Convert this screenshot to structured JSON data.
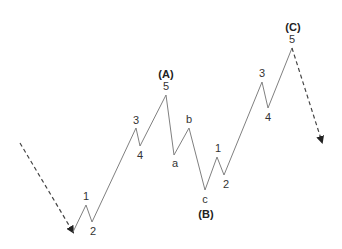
{
  "diagram": {
    "colors": {
      "line": "#808080",
      "text": "#333333",
      "arrow": "#222222"
    },
    "lead_in": {
      "from": [
        20,
        143
      ],
      "to": [
        73,
        232
      ],
      "style": "dashed",
      "arrow": true
    },
    "wave_path": [
      [
        73,
        232
      ],
      [
        86,
        205
      ],
      [
        92,
        222
      ],
      [
        136,
        128
      ],
      [
        140,
        146
      ],
      [
        166,
        95
      ],
      [
        174,
        155
      ],
      [
        189,
        128
      ],
      [
        205,
        190
      ],
      [
        217,
        157
      ],
      [
        224,
        175
      ],
      [
        262,
        82
      ],
      [
        268,
        108
      ],
      [
        292,
        48
      ]
    ],
    "lead_out": {
      "from": [
        292,
        48
      ],
      "to": [
        322,
        142
      ],
      "style": "dashed",
      "arrow": true
    },
    "labels": [
      {
        "id": "w1-a",
        "text": "1",
        "x": 86,
        "y": 200
      },
      {
        "id": "w2-a",
        "text": "2",
        "x": 93,
        "y": 235
      },
      {
        "id": "w3-a",
        "text": "3",
        "x": 136,
        "y": 124
      },
      {
        "id": "w4-a",
        "text": "4",
        "x": 140,
        "y": 159
      },
      {
        "id": "w5-a",
        "text": "5",
        "x": 166,
        "y": 90
      },
      {
        "id": "wa",
        "text": "a",
        "x": 175,
        "y": 167
      },
      {
        "id": "wb",
        "text": "b",
        "x": 189,
        "y": 123
      },
      {
        "id": "wc",
        "text": "c",
        "x": 205,
        "y": 203
      },
      {
        "id": "w1-c",
        "text": "1",
        "x": 218,
        "y": 152
      },
      {
        "id": "w2-c",
        "text": "2",
        "x": 226,
        "y": 188
      },
      {
        "id": "w3-c",
        "text": "3",
        "x": 262,
        "y": 77
      },
      {
        "id": "w4-c",
        "text": "4",
        "x": 268,
        "y": 121
      },
      {
        "id": "w5-c",
        "text": "5",
        "x": 292,
        "y": 43
      }
    ],
    "degree_labels": [
      {
        "id": "A",
        "text": "(A)",
        "x": 166,
        "y": 78
      },
      {
        "id": "B",
        "text": "(B)",
        "x": 206,
        "y": 218
      },
      {
        "id": "C",
        "text": "(C)",
        "x": 293,
        "y": 31
      }
    ]
  }
}
